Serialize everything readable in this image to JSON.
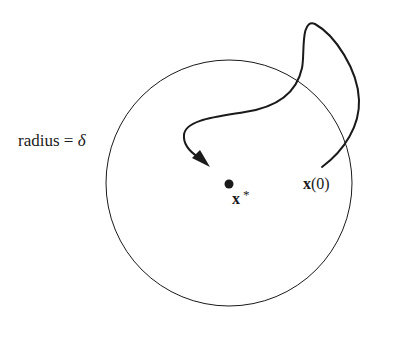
{
  "diagram": {
    "type": "stability-neighborhood",
    "colors": {
      "stroke": "#1a1a1a",
      "background": "#ffffff"
    },
    "circle": {
      "cx": 229,
      "cy": 183,
      "r": 123
    },
    "equilibrium_point": {
      "cx": 229,
      "cy": 184,
      "r": 4.5
    },
    "labels": {
      "radius_prefix": "radius = ",
      "radius_symbol": "δ",
      "equilibrium_bold": "x",
      "equilibrium_sup": "*",
      "initial_bold": "x",
      "initial_paren": "(0)"
    },
    "trajectory": {
      "start": [
        322,
        167
      ],
      "end_arrow_tip": [
        210,
        166
      ],
      "description": "trajectory from x(0) leaving the circle, looping above and re-entering toward x*"
    }
  }
}
